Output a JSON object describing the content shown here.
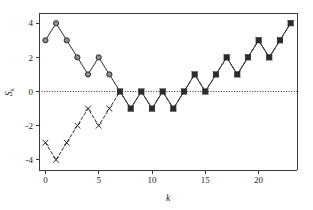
{
  "chart_data": {
    "type": "line",
    "title": "",
    "subtitle": "",
    "xlabel": "k",
    "ylabel": "S_k",
    "ylabel_base": "S",
    "ylabel_subscript": "k",
    "x": [
      0,
      1,
      2,
      3,
      4,
      5,
      6,
      7,
      8,
      9,
      10,
      11,
      12,
      13,
      14,
      15,
      16,
      17,
      18,
      19,
      20,
      21,
      22,
      23
    ],
    "xlim": [
      -0.6,
      23.6
    ],
    "ylim": [
      -4.6,
      4.6
    ],
    "xticks": [
      0,
      5,
      10,
      15,
      20
    ],
    "xtick_labels": [
      "0",
      "5",
      "10",
      "15",
      "20"
    ],
    "yticks": [
      4,
      2,
      0,
      -2,
      -4
    ],
    "ytick_labels": [
      "4",
      "2",
      "0",
      "-2",
      "-4"
    ],
    "grid": false,
    "zero_reference_line": {
      "value": 0,
      "style": "dotted",
      "color": "#2b2b2b"
    },
    "legend": null,
    "legend_position": "none",
    "annotations": [],
    "series": [
      {
        "name": "walk-upper",
        "marker": "circle",
        "linestyle": "solid",
        "color": "#2b2b2b",
        "marker_fill": "#8c8c8c",
        "x_start": 0,
        "values": [
          3,
          4,
          3,
          2,
          1,
          2,
          1,
          0,
          -1,
          0,
          -1,
          0,
          -1,
          0,
          1,
          0,
          1,
          2,
          1,
          2,
          3,
          2,
          3,
          4
        ]
      },
      {
        "name": "walk-lower",
        "marker": "x",
        "linestyle": "dashed",
        "color": "#2b2b2b",
        "x_start": 0,
        "values": [
          -3,
          -4,
          -3,
          -2,
          -1,
          -2,
          -1,
          0,
          -1,
          0,
          -1,
          0,
          -1,
          0,
          1,
          0,
          1,
          2,
          1,
          2,
          3,
          2,
          3,
          4
        ]
      }
    ],
    "coalescence_index": 7,
    "coalescence_value": 0
  },
  "figure": {
    "background_color": "#ffffff",
    "axes_color": "#3a3a3a",
    "plot_left": 39,
    "plot_right": 297,
    "plot_top": 13,
    "plot_bottom": 170
  }
}
